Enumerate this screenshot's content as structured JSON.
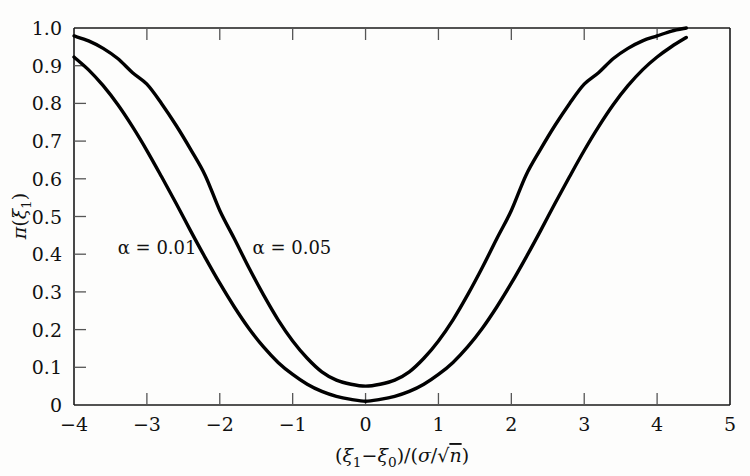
{
  "chart_data": {
    "type": "line",
    "title": "",
    "subtitle": "",
    "xlabel": "(ξ₁ − ξ₀)/(σ/√n)",
    "ylabel": "π(ξ₁)",
    "xlim": [
      -4,
      5
    ],
    "ylim": [
      0,
      1.0
    ],
    "grid": false,
    "legend_position": "inline-annotation",
    "x_ticks": [
      -4,
      -3,
      -2,
      -1,
      0,
      1,
      2,
      3,
      4,
      5
    ],
    "x_tick_labels": [
      "−4",
      "−3",
      "−2",
      "−1",
      "0",
      "1",
      "2",
      "3",
      "4",
      "5"
    ],
    "y_ticks": [
      0,
      0.1,
      0.2,
      0.3,
      0.4,
      0.5,
      0.6,
      0.7,
      0.8,
      0.9,
      1.0
    ],
    "y_tick_labels": [
      "0",
      "0.1",
      "0.2",
      "0.3",
      "0.4",
      "0.5",
      "0.6",
      "0.7",
      "0.8",
      "0.9",
      "1.0"
    ],
    "x": [
      -4.0,
      -3.8,
      -3.6,
      -3.4,
      -3.2,
      -3.0,
      -2.8,
      -2.6,
      -2.4,
      -2.2,
      -2.0,
      -1.8,
      -1.6,
      -1.4,
      -1.2,
      -1.0,
      -0.8,
      -0.6,
      -0.4,
      -0.2,
      0.0,
      0.2,
      0.4,
      0.6,
      0.8,
      1.0,
      1.2,
      1.4,
      1.6,
      1.8,
      2.0,
      2.2,
      2.4,
      2.6,
      2.8,
      3.0,
      3.2,
      3.4,
      3.6,
      3.8,
      4.0,
      4.2,
      4.4
    ],
    "series": [
      {
        "name": "α = 0.05",
        "label": "α = 0.05",
        "alpha": 0.05,
        "critical_value": 1.96,
        "values": [
          0.979,
          0.966,
          0.946,
          0.919,
          0.882,
          0.851,
          0.8,
          0.742,
          0.678,
          0.609,
          0.516,
          0.441,
          0.364,
          0.292,
          0.226,
          0.17,
          0.124,
          0.088,
          0.066,
          0.055,
          0.05,
          0.055,
          0.066,
          0.088,
          0.124,
          0.17,
          0.226,
          0.292,
          0.364,
          0.441,
          0.516,
          0.609,
          0.678,
          0.742,
          0.8,
          0.851,
          0.882,
          0.919,
          0.946,
          0.966,
          0.979,
          0.992,
          1.0
        ],
        "label_position": {
          "x": -1.55,
          "y": 0.4
        }
      },
      {
        "name": "α = 0.01",
        "label": "α = 0.01",
        "alpha": 0.01,
        "critical_value": 2.576,
        "values": [
          0.923,
          0.889,
          0.847,
          0.797,
          0.739,
          0.675,
          0.606,
          0.535,
          0.462,
          0.391,
          0.323,
          0.26,
          0.203,
          0.154,
          0.113,
          0.081,
          0.055,
          0.036,
          0.023,
          0.015,
          0.01,
          0.015,
          0.023,
          0.036,
          0.055,
          0.081,
          0.113,
          0.154,
          0.203,
          0.26,
          0.323,
          0.391,
          0.462,
          0.535,
          0.606,
          0.675,
          0.739,
          0.797,
          0.847,
          0.889,
          0.923,
          0.951,
          0.975
        ],
        "label_position": {
          "x": -3.4,
          "y": 0.4
        }
      }
    ],
    "annotations": [
      {
        "text": "α = 0.01",
        "x": -3.4,
        "y": 0.4
      },
      {
        "text": "α = 0.05",
        "x": -1.55,
        "y": 0.4
      }
    ],
    "colors": {
      "curve": "#000000",
      "axis": "#1a1a1a",
      "tick": "#555555",
      "background": "#fdfdfc",
      "text": "#111111"
    }
  },
  "axis_label_parts": {
    "ylabel": {
      "pi": "π",
      "open": "(",
      "xi": "ξ",
      "sub": "1",
      "close": ")"
    },
    "xlabel": {
      "open": "(",
      "xi1": "ξ",
      "sub1": "1",
      "minus": "−",
      "xi0": "ξ",
      "sub0": "0",
      "closeslash": ")/(",
      "sigma": "σ",
      "slash": "/",
      "radical": "√",
      "n": "n",
      "close": ")"
    }
  }
}
